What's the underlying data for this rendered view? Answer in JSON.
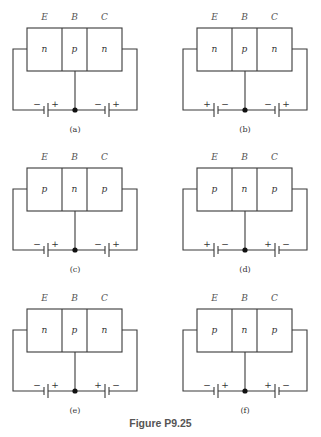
{
  "figure": {
    "caption": "Figure P9.25",
    "terminal_labels": [
      "E",
      "B",
      "C"
    ],
    "panels": [
      {
        "id": "a",
        "label": "(a)",
        "regions": [
          "n",
          "p",
          "n"
        ],
        "left_battery": [
          "−",
          "+"
        ],
        "right_battery": [
          "−",
          "+"
        ]
      },
      {
        "id": "b",
        "label": "(b)",
        "regions": [
          "n",
          "p",
          "n"
        ],
        "left_battery": [
          "+",
          "−"
        ],
        "right_battery": [
          "−",
          "+"
        ]
      },
      {
        "id": "c",
        "label": "(c)",
        "regions": [
          "p",
          "n",
          "p"
        ],
        "left_battery": [
          "−",
          "+"
        ],
        "right_battery": [
          "−",
          "+"
        ]
      },
      {
        "id": "d",
        "label": "(d)",
        "regions": [
          "p",
          "n",
          "p"
        ],
        "left_battery": [
          "+",
          "−"
        ],
        "right_battery": [
          "+",
          "−"
        ]
      },
      {
        "id": "e",
        "label": "(e)",
        "regions": [
          "n",
          "p",
          "n"
        ],
        "left_battery": [
          "−",
          "+"
        ],
        "right_battery": [
          "+",
          "−"
        ]
      },
      {
        "id": "f",
        "label": "(f)",
        "regions": [
          "p",
          "n",
          "p"
        ],
        "left_battery": [
          "−",
          "+"
        ],
        "right_battery": [
          "+",
          "−"
        ]
      }
    ]
  }
}
